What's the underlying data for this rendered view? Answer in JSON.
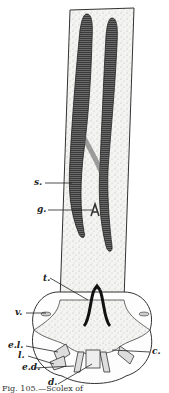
{
  "figure": {
    "labels": {
      "s": "s.",
      "g": "g.",
      "t": "t.",
      "v": "v.",
      "el": "e.l.",
      "l": "l.",
      "ed": "e.d.",
      "d": "d.",
      "c": "c."
    },
    "caption": "Fig. 105.—Scolex of"
  }
}
